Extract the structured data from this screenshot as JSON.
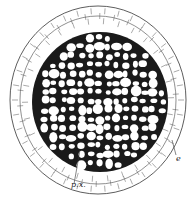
{
  "figure": {
    "labels": [
      {
        "id": "px",
        "text": "p.x.",
        "x": 71,
        "y": 186
      },
      {
        "id": "e",
        "text": "e",
        "x": 176,
        "y": 160
      }
    ],
    "colors": {
      "ink": "#1a1a1a",
      "paper": "#ffffff"
    }
  }
}
